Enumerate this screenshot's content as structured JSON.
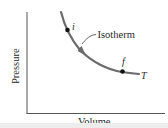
{
  "diagram": {
    "axes": {
      "xlabel": "Volume",
      "ylabel": "Pressure"
    },
    "curve": {
      "name": "Isotherm",
      "temperature_label": "T",
      "color": "#6b6b6b",
      "direction": "from i to f (arrow pointing down-right)"
    },
    "points": [
      {
        "label": "i",
        "role": "initial state"
      },
      {
        "label": "f",
        "role": "final state"
      }
    ],
    "colors": {
      "axis": "#555555",
      "curve": "#6b6b6b",
      "points": "#111111",
      "text": "#2a2a2a"
    }
  }
}
